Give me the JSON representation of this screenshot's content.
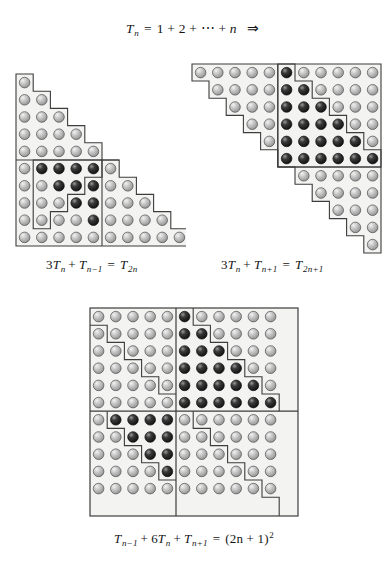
{
  "figure": {
    "kind": "proof-without-words",
    "n": 5,
    "dot_diameter_px": 10.6,
    "cell_px": 17.2,
    "colors": {
      "background": "#ffffff",
      "panel_fill": "#f3f3f1",
      "outline": "#3d3d3d",
      "dot_light_edge": "#5b5b5b",
      "dot_light_body": "#b9b9b9",
      "dot_light_high": "#efefef",
      "dot_dark_edge": "#0d0d0d",
      "dot_dark_body": "#2e2e2e",
      "dot_dark_high": "#8f8f8f",
      "text": "#141414"
    }
  },
  "title": {
    "text": "T_n = 1 + 2 + ... + n  =>",
    "parts": {
      "lhs": "T",
      "lhs_sub": "n",
      "eq": "=",
      "series": "1 + 2 + ⋯ + ",
      "last": "n",
      "arrow": "⇒"
    }
  },
  "panels": [
    {
      "id": "left",
      "name": "triangle-T2n",
      "shape": "staircase-triangle",
      "rows": 10,
      "row_counts": [
        1,
        2,
        3,
        4,
        5,
        6,
        7,
        8,
        9,
        10
      ],
      "total_dots": 55,
      "caption": {
        "text": "3T_n + T_{n-1} = T_{2n}",
        "parts": {
          "coef": "3",
          "t1": "T",
          "t1_sub": "n",
          "plus": "+",
          "t2": "T",
          "t2_sub": "n−1",
          "eq": "=",
          "t3": "T",
          "t3_sub": "2n"
        }
      },
      "regions": [
        {
          "name": "top-triangle-Tn",
          "shade": "light",
          "rows": [
            1,
            2,
            3,
            4,
            5
          ]
        },
        {
          "name": "inner-triangle-Tn-minus-1",
          "shade": "dark",
          "rows": [
            6,
            7,
            8,
            9
          ]
        },
        {
          "name": "left-triangle-Tn",
          "shade": "light",
          "rows": [
            6,
            7,
            8,
            9,
            10
          ]
        },
        {
          "name": "right-triangle-Tn",
          "shade": "light",
          "rows": [
            6,
            7,
            8,
            9,
            10
          ]
        }
      ]
    },
    {
      "id": "right",
      "name": "triangle-T2n-plus-1",
      "shape": "staircase-triangle-inverted",
      "rows": 11,
      "row_counts": [
        11,
        10,
        9,
        8,
        7,
        6,
        5,
        4,
        3,
        2,
        1
      ],
      "total_dots": 66,
      "caption": {
        "text": "3T_n + T_{n+1} = T_{2n+1}",
        "parts": {
          "coef": "3",
          "t1": "T",
          "t1_sub": "n",
          "plus": "+",
          "t2": "T",
          "t2_sub": "n+1",
          "eq": "=",
          "t3": "T",
          "t3_sub": "2n+1"
        }
      },
      "regions": [
        {
          "name": "top-left-triangle-Tn",
          "shade": "light",
          "rows": [
            1,
            2,
            3,
            4,
            5
          ]
        },
        {
          "name": "center-triangle-Tn-plus-1",
          "shade": "dark",
          "rows": [
            1,
            2,
            3,
            4,
            5,
            6
          ]
        },
        {
          "name": "upper-right-triangle-Tn",
          "shade": "light",
          "rows": [
            1,
            2,
            3,
            4,
            5
          ]
        },
        {
          "name": "lower-right-triangle-Tn",
          "shade": "light",
          "rows": [
            7,
            8,
            9,
            10,
            11
          ]
        }
      ]
    },
    {
      "id": "bottom",
      "name": "square-2n-plus-1",
      "shape": "square",
      "rows": 11,
      "cols": 11,
      "total_dots": 121,
      "caption": {
        "text": "T_{n-1} + 6T_n + T_{n+1} = (2n + 1)^2",
        "parts": {
          "t1": "T",
          "t1_sub": "n−1",
          "plus1": "+",
          "coef": "6",
          "t2": "T",
          "t2_sub": "n",
          "plus2": "+",
          "t3": "T",
          "t3_sub": "n+1",
          "eq": "=",
          "rhs": "(2n + 1)",
          "rhs_sup": "2"
        }
      },
      "quadrants": [
        {
          "name": "top-left-quadrant",
          "cols": 5,
          "rows": 6,
          "inner": "triangle-Tn",
          "shade": "light"
        },
        {
          "name": "top-right-quadrant",
          "cols": 6,
          "rows": 6,
          "inner": "triangle-Tn-plus-1",
          "shade": "dark"
        },
        {
          "name": "bottom-left-quadrant",
          "cols": 5,
          "rows": 5,
          "inner": "triangle-Tn",
          "shade": "dark"
        },
        {
          "name": "bottom-right-quadrant",
          "cols": 6,
          "rows": 5,
          "inner": "triangle-Tn",
          "shade": "light"
        }
      ]
    }
  ]
}
